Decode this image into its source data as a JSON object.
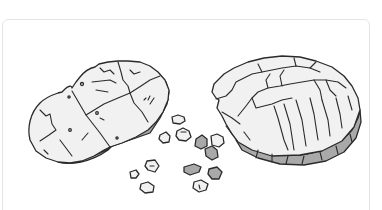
{
  "illustration": {
    "subject": "broken cookie with scattered crumbs",
    "style": "grayscale line art",
    "pieces": [
      {
        "name": "left-half",
        "fragments": 4
      },
      {
        "name": "right-half",
        "fragments": 1
      }
    ],
    "crumbs_count": 12,
    "colors": {
      "outline": "#2a2a2a",
      "surface": "#f1f1f1",
      "shadow": "#a9a9a9",
      "card_border": "#e4e4e4",
      "background": "#ffffff"
    }
  }
}
